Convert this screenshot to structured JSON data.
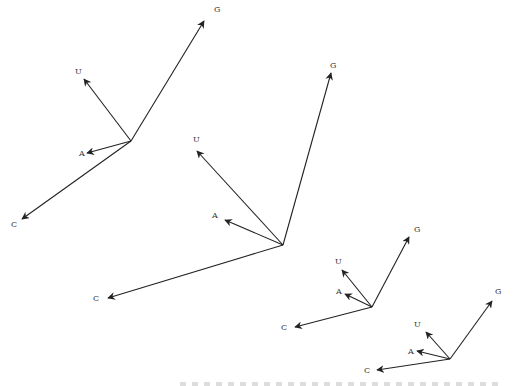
{
  "diagrams": [
    {
      "origin": [
        131,
        141
      ],
      "vectors": [
        {
          "label": "G",
          "tip": [
            204,
            21
          ],
          "label_pos": [
            214,
            12
          ]
        },
        {
          "label": "U",
          "tip": [
            84,
            79
          ],
          "label_pos": [
            75,
            74
          ]
        },
        {
          "label": "A",
          "tip": [
            87,
            153
          ],
          "label_pos": [
            79,
            156
          ]
        },
        {
          "label": "C",
          "tip": [
            22,
            219
          ],
          "label_pos": [
            11,
            227
          ]
        }
      ]
    },
    {
      "origin": [
        283,
        245
      ],
      "vectors": [
        {
          "label": "G",
          "tip": [
            331,
            73
          ],
          "label_pos": [
            330,
            68
          ]
        },
        {
          "label": "U",
          "tip": [
            197,
            151
          ],
          "label_pos": [
            193,
            142
          ]
        },
        {
          "label": "A",
          "tip": [
            225,
            220
          ],
          "label_pos": [
            212,
            218
          ]
        },
        {
          "label": "C",
          "tip": [
            108,
            298
          ],
          "label_pos": [
            93,
            301
          ]
        }
      ]
    },
    {
      "origin": [
        372,
        307
      ],
      "vectors": [
        {
          "label": "G",
          "tip": [
            409,
            237
          ],
          "label_pos": [
            414,
            232
          ]
        },
        {
          "label": "U",
          "tip": [
            342,
            270
          ],
          "label_pos": [
            335,
            264
          ]
        },
        {
          "label": "A",
          "tip": [
            345,
            294
          ],
          "label_pos": [
            336,
            294
          ]
        },
        {
          "label": "C",
          "tip": [
            295,
            327
          ],
          "label_pos": [
            281,
            330
          ]
        }
      ]
    },
    {
      "origin": [
        450,
        359
      ],
      "vectors": [
        {
          "label": "G",
          "tip": [
            492,
            301
          ],
          "label_pos": [
            495,
            294
          ]
        },
        {
          "label": "U",
          "tip": [
            426,
            332
          ],
          "label_pos": [
            414,
            327
          ]
        },
        {
          "label": "A",
          "tip": [
            417,
            351
          ],
          "label_pos": [
            408,
            354
          ]
        },
        {
          "label": "C",
          "tip": [
            377,
            370
          ],
          "label_pos": [
            364,
            373
          ]
        }
      ]
    }
  ],
  "colors": {
    "stroke": "#222222",
    "label": "#333333"
  }
}
